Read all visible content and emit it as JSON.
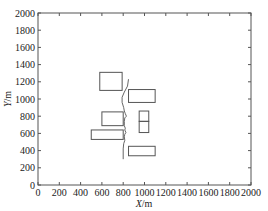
{
  "chart_data": {
    "type": "scatter",
    "title": "",
    "xlabel_var": "X",
    "xlabel_unit": "/m",
    "ylabel_var": "Y",
    "ylabel_unit": "/m",
    "xlim": [
      0,
      2000
    ],
    "ylim": [
      0,
      2000
    ],
    "grid": false,
    "legend": null,
    "x_ticks": [
      0,
      200,
      400,
      600,
      800,
      1000,
      1200,
      1400,
      1600,
      1800,
      2000
    ],
    "y_ticks": [
      0,
      200,
      400,
      600,
      800,
      1000,
      1200,
      1400,
      1600,
      1800,
      2000
    ],
    "rectangles": [
      {
        "name": "block-1",
        "x0": 580,
        "x1": 790,
        "y0": 1100,
        "y1": 1310
      },
      {
        "name": "block-2",
        "x0": 850,
        "x1": 1100,
        "y0": 960,
        "y1": 1110
      },
      {
        "name": "block-3",
        "x0": 600,
        "x1": 800,
        "y0": 690,
        "y1": 850
      },
      {
        "name": "block-4",
        "x0": 950,
        "x1": 1040,
        "y0": 740,
        "y1": 860
      },
      {
        "name": "block-5",
        "x0": 950,
        "x1": 1040,
        "y0": 610,
        "y1": 740
      },
      {
        "name": "block-6",
        "x0": 500,
        "x1": 800,
        "y0": 530,
        "y1": 640
      },
      {
        "name": "block-7",
        "x0": 850,
        "x1": 1100,
        "y0": 340,
        "y1": 450
      }
    ],
    "curve": {
      "name": "path-line",
      "points": [
        [
          850,
          1230
        ],
        [
          840,
          1150
        ],
        [
          810,
          1080
        ],
        [
          790,
          1020
        ],
        [
          790,
          960
        ],
        [
          805,
          900
        ],
        [
          810,
          860
        ],
        [
          820,
          830
        ],
        [
          830,
          800
        ],
        [
          815,
          780
        ],
        [
          810,
          740
        ],
        [
          810,
          690
        ],
        [
          820,
          660
        ],
        [
          815,
          640
        ],
        [
          825,
          610
        ],
        [
          815,
          590
        ],
        [
          810,
          560
        ],
        [
          815,
          520
        ],
        [
          805,
          480
        ],
        [
          800,
          420
        ],
        [
          800,
          360
        ],
        [
          800,
          300
        ]
      ]
    }
  }
}
